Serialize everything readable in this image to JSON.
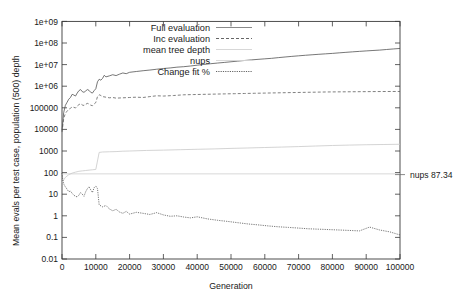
{
  "chart_data": {
    "type": "line",
    "title": "",
    "xlabel": "Generation",
    "ylabel": "Mean evals per test case, population (500) depth",
    "xlim": [
      0,
      100000
    ],
    "ylim": [
      0.01,
      1000000000
    ],
    "yscale": "log",
    "xscale": "linear",
    "grid": false,
    "legend_position": "top-left-inside",
    "xticks": [
      0,
      10000,
      20000,
      30000,
      40000,
      50000,
      60000,
      70000,
      80000,
      90000,
      100000
    ],
    "xtick_labels": [
      "0",
      "10000",
      "20000",
      "30000",
      "40000",
      "50000",
      "60000",
      "70000",
      "80000",
      "90000",
      "100000"
    ],
    "yticks": [
      0.01,
      0.1,
      1,
      10,
      100,
      1000,
      10000,
      100000,
      1000000,
      10000000,
      100000000,
      1000000000
    ],
    "ytick_labels": [
      "0.01",
      "0.1",
      "1",
      "10",
      "100",
      "1000",
      "10000",
      "100000",
      "1e+06",
      "1e+07",
      "1e+08",
      "1e+09"
    ],
    "annotations": [
      {
        "text": "nups 87.34",
        "x": 100000,
        "y": 87.34,
        "placement": "right-outside"
      }
    ],
    "series": [
      {
        "name": "Full evaluation",
        "style": "solid",
        "color": "#4a4a4a",
        "x": [
          0,
          500,
          1000,
          1500,
          2000,
          2500,
          3000,
          3500,
          4000,
          4500,
          5000,
          5500,
          6000,
          6500,
          7000,
          7500,
          8000,
          8500,
          9000,
          9500,
          10000,
          10500,
          11000,
          11500,
          12000,
          12500,
          13000,
          14000,
          15000,
          16000,
          17000,
          18000,
          19000,
          20000,
          22000,
          24000,
          26000,
          28000,
          30000,
          32000,
          34000,
          36000,
          38000,
          40000,
          42000,
          44000,
          46000,
          48000,
          50000,
          52000,
          54000,
          56000,
          58000,
          60000,
          62000,
          64000,
          66000,
          68000,
          70000,
          72000,
          74000,
          76000,
          78000,
          80000,
          82000,
          84000,
          86000,
          88000,
          90000,
          92000,
          94000,
          96000,
          98000,
          100000
        ],
        "y": [
          9000,
          60000,
          130000,
          180000,
          250000,
          300000,
          420000,
          390000,
          350000,
          480000,
          620000,
          700000,
          560000,
          520000,
          600000,
          700000,
          640000,
          520000,
          480000,
          620000,
          760000,
          1600000,
          2100000,
          1900000,
          2300000,
          3200000,
          2700000,
          3000000,
          3400000,
          3100000,
          3600000,
          4100000,
          3800000,
          4400000,
          4800000,
          5200000,
          5600000,
          6100000,
          6600000,
          7000000,
          7600000,
          8000000,
          8600000,
          9400000,
          10200000,
          11000000,
          11800000,
          12600000,
          13500000,
          14500000,
          15500000,
          16500000,
          17500000,
          18500000,
          19500000,
          21000000,
          22500000,
          24000000,
          25500000,
          27000000,
          28500000,
          30000000,
          31500000,
          33000000,
          35000000,
          37000000,
          39000000,
          41000000,
          43000000,
          45000000,
          47000000,
          50000000,
          53000000,
          56000000
        ]
      },
      {
        "name": "Inc evaluation",
        "style": "dashed",
        "color": "#555555",
        "x": [
          0,
          500,
          1000,
          1500,
          2000,
          2500,
          3000,
          3500,
          4000,
          4500,
          5000,
          5500,
          6000,
          6500,
          7000,
          7500,
          8000,
          8500,
          9000,
          9500,
          10000,
          10500,
          11000,
          11500,
          12000,
          13000,
          14000,
          15000,
          16000,
          18000,
          20000,
          22000,
          24000,
          26000,
          28000,
          30000,
          33000,
          36000,
          39000,
          42000,
          45000,
          48000,
          51000,
          54000,
          57000,
          60000,
          63000,
          66000,
          69000,
          72000,
          75000,
          78000,
          81000,
          84000,
          87000,
          90000,
          93000,
          96000,
          100000
        ],
        "y": [
          7500,
          32000,
          55000,
          70000,
          85000,
          95000,
          110000,
          105000,
          98000,
          120000,
          140000,
          155000,
          135000,
          128000,
          145000,
          160000,
          150000,
          132000,
          125000,
          150000,
          175000,
          330000,
          400000,
          370000,
          330000,
          310000,
          290000,
          300000,
          280000,
          290000,
          300000,
          310000,
          300000,
          330000,
          360000,
          350000,
          370000,
          400000,
          410000,
          420000,
          430000,
          440000,
          450000,
          460000,
          470000,
          480000,
          490000,
          500000,
          510000,
          520000,
          530000,
          540000,
          545000,
          550000,
          555000,
          560000,
          565000,
          568000,
          570000
        ]
      },
      {
        "name": "mean tree depth",
        "style": "solid",
        "color": "#c9c9c9",
        "x": [
          0,
          1000,
          2000,
          3000,
          4000,
          5000,
          6000,
          7000,
          8000,
          9000,
          10000,
          11000,
          12000,
          14000,
          16000,
          18000,
          20000,
          25000,
          30000,
          35000,
          40000,
          45000,
          50000,
          55000,
          60000,
          65000,
          70000,
          75000,
          80000,
          85000,
          90000,
          95000,
          100000
        ],
        "y": [
          35,
          60,
          80,
          95,
          105,
          115,
          120,
          125,
          130,
          135,
          140,
          860,
          900,
          920,
          940,
          980,
          1000,
          1060,
          1100,
          1150,
          1200,
          1250,
          1320,
          1380,
          1450,
          1520,
          1600,
          1700,
          1800,
          1880,
          1950,
          2000,
          2050
        ]
      },
      {
        "name": "nups",
        "style": "solid",
        "color": "#cfcfcf",
        "x": [
          0,
          100000
        ],
        "y": [
          87.34,
          87.34
        ]
      },
      {
        "name": "Change fit %",
        "style": "dotted",
        "color": "#3c3c3c",
        "x": [
          0,
          300,
          600,
          1000,
          1500,
          2000,
          2500,
          3000,
          3500,
          4000,
          4500,
          5000,
          5500,
          6000,
          6500,
          7000,
          7500,
          8000,
          8500,
          9000,
          9500,
          10000,
          10500,
          11000,
          12000,
          13000,
          14000,
          15000,
          16000,
          17000,
          18000,
          19000,
          20000,
          22000,
          24000,
          26000,
          28000,
          30000,
          32000,
          34000,
          36000,
          38000,
          40000,
          43000,
          46000,
          49000,
          52000,
          55000,
          58000,
          61000,
          64000,
          67000,
          70000,
          73000,
          76000,
          79000,
          82000,
          85000,
          88000,
          91000,
          94000,
          97000,
          100000
        ],
        "y": [
          95,
          40,
          28,
          22,
          17,
          13,
          14,
          11,
          9,
          8,
          7.5,
          9,
          12,
          10,
          8,
          13,
          18,
          22,
          16,
          12,
          20,
          24,
          18,
          3.2,
          2.6,
          3.0,
          2.1,
          1.7,
          2.0,
          1.5,
          1.3,
          1.6,
          1.2,
          1.45,
          1.3,
          1.15,
          1.4,
          1.1,
          0.95,
          1.0,
          0.88,
          0.8,
          0.9,
          0.72,
          0.62,
          0.55,
          0.48,
          0.42,
          0.38,
          0.34,
          0.31,
          0.29,
          0.27,
          0.25,
          0.24,
          0.23,
          0.22,
          0.21,
          0.2,
          0.3,
          0.22,
          0.18,
          0.13
        ]
      }
    ]
  },
  "axes": {
    "xlabel": "Generation",
    "ylabel": "Mean evals per test case, population (500) depth",
    "xtick_labels": [
      "0",
      "10000",
      "20000",
      "30000",
      "40000",
      "50000",
      "60000",
      "70000",
      "80000",
      "90000",
      "100000"
    ],
    "ytick_labels": [
      "0.01",
      "0.1",
      "1",
      "10",
      "100",
      "1000",
      "10000",
      "100000",
      "1e+06",
      "1e+07",
      "1e+08",
      "1e+09"
    ]
  },
  "legend": {
    "entries": [
      {
        "label": "Full evaluation",
        "style": "solid"
      },
      {
        "label": "Inc evaluation",
        "style": "dashed"
      },
      {
        "label": "mean tree depth",
        "style": "solid-light"
      },
      {
        "label": "nups",
        "style": "solid-light"
      },
      {
        "label": "Change fit %",
        "style": "dotted"
      }
    ]
  },
  "annotation": {
    "nups_label": "nups 87.34"
  }
}
